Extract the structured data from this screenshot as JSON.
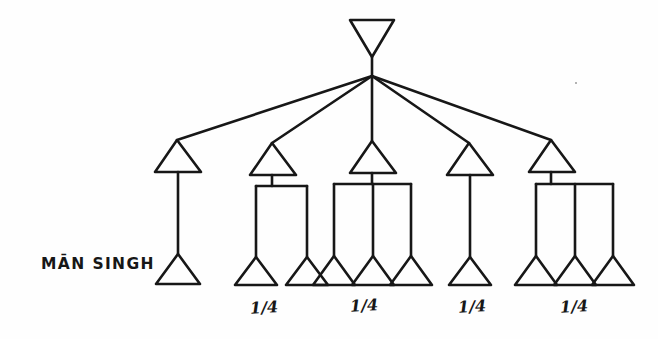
{
  "figure": {
    "type": "kinship-genealogy-diagram",
    "background_color": "#fefefe",
    "ink_color": "#171717",
    "width": 658,
    "height": 339
  },
  "labels": {
    "ego_label": "MĀN SINGH",
    "share_1": "1/4",
    "share_2": "1/4",
    "share_3": "1/4",
    "share_4": "1/4"
  },
  "nodes": {
    "root": {
      "name": "apex-female",
      "symbol": "inverted-triangle",
      "sex": "female"
    },
    "generation_2": [
      {
        "name": "g2-son-1",
        "symbol": "triangle",
        "sex": "male",
        "children": 1
      },
      {
        "name": "g2-son-2",
        "symbol": "triangle",
        "sex": "male",
        "children": 2
      },
      {
        "name": "g2-son-3",
        "symbol": "triangle",
        "sex": "male",
        "children": 3
      },
      {
        "name": "g2-son-4",
        "symbol": "triangle",
        "sex": "male",
        "children": 1
      },
      {
        "name": "g2-son-5",
        "symbol": "triangle",
        "sex": "male",
        "children": 3
      }
    ],
    "generation_3": [
      {
        "name": "g3-child-1",
        "symbol": "triangle",
        "sex": "male",
        "parent": "g2-son-1",
        "is_ego": true
      },
      {
        "name": "g3-child-2",
        "symbol": "triangle",
        "sex": "male",
        "parent": "g2-son-2"
      },
      {
        "name": "g3-child-3",
        "symbol": "triangle",
        "sex": "male",
        "parent": "g2-son-2"
      },
      {
        "name": "g3-child-4",
        "symbol": "triangle",
        "sex": "male",
        "parent": "g2-son-3"
      },
      {
        "name": "g3-child-5",
        "symbol": "triangle",
        "sex": "male",
        "parent": "g2-son-3"
      },
      {
        "name": "g3-child-6",
        "symbol": "triangle",
        "sex": "male",
        "parent": "g2-son-3"
      },
      {
        "name": "g3-child-7",
        "symbol": "triangle",
        "sex": "male",
        "parent": "g2-son-4"
      },
      {
        "name": "g3-child-8",
        "symbol": "triangle",
        "sex": "male",
        "parent": "g2-son-5"
      },
      {
        "name": "g3-child-9",
        "symbol": "triangle",
        "sex": "male",
        "parent": "g2-son-5"
      },
      {
        "name": "g3-child-10",
        "symbol": "triangle",
        "sex": "male",
        "parent": "g2-son-5"
      }
    ]
  }
}
